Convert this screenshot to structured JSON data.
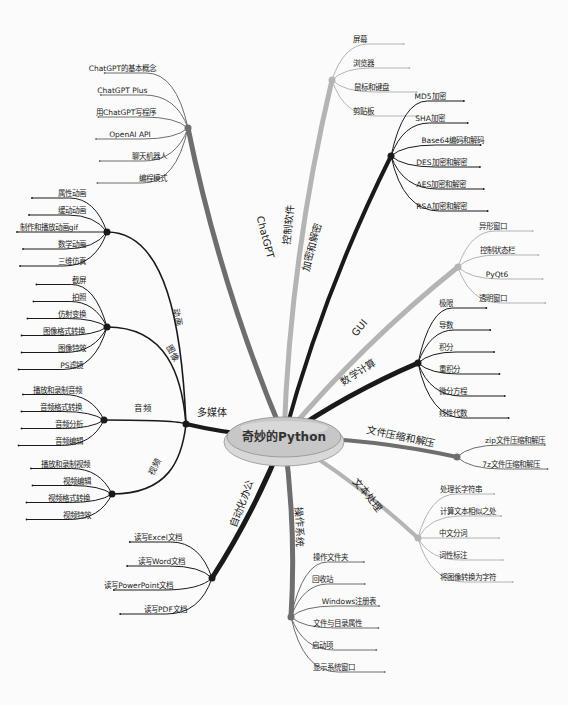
{
  "root": {
    "label": "奇妙的Python",
    "x": 284,
    "y": 437
  },
  "colors": {
    "dark": "#1a1a1a",
    "mid": "#6e6e6e",
    "light": "#b4b4b4",
    "root_fill": "#c9c9c9",
    "root_stroke": "#9a9a9a"
  },
  "branches": [
    {
      "id": "chatgpt",
      "label": "ChatGPT",
      "color": "mid",
      "width": 5,
      "hub": [
        188,
        128
      ],
      "label_pos": [
        262,
        238
      ],
      "label_rot": 75,
      "children": [
        "ChatGPT的基本概念",
        "ChatGPT Plus",
        "用ChatGPT写程序",
        "OpenAI API",
        "聊天机器人",
        "编程模式"
      ]
    },
    {
      "id": "control",
      "label": "控制软件",
      "color": "light",
      "width": 5,
      "hub": [
        332,
        80
      ],
      "label_pos": [
        292,
        225
      ],
      "label_rot": -85,
      "children": [
        "屏幕",
        "浏览器",
        "鼠标和键盘",
        "剪贴板"
      ]
    },
    {
      "id": "crypto",
      "label": "加密和解密",
      "color": "dark",
      "width": 4,
      "hub": [
        391,
        156
      ],
      "label_pos": [
        315,
        248
      ],
      "label_rot": -75,
      "children": [
        "MD5加密",
        "SHA加密",
        "Base64编码和解码",
        "DES加密和解密",
        "AES加密和解密",
        "RSA加密和解密"
      ]
    },
    {
      "id": "gui",
      "label": "GUI",
      "color": "light",
      "width": 5,
      "hub": [
        458,
        267
      ],
      "label_pos": [
        362,
        330
      ],
      "label_rot": -50,
      "children": [
        "异形窗口",
        "控制状态栏",
        "PyQt6",
        "透明窗口"
      ]
    },
    {
      "id": "math",
      "label": "数学计算",
      "color": "dark",
      "width": 5,
      "hub": [
        418,
        363
      ],
      "label_pos": [
        360,
        375
      ],
      "label_rot": -32,
      "children": [
        "极限",
        "导数",
        "积分",
        "重积分",
        "微分方程",
        "线性代数"
      ]
    },
    {
      "id": "zip",
      "label": "文件压缩和解压",
      "color": "mid",
      "width": 4,
      "hub": [
        457,
        457
      ],
      "label_pos": [
        400,
        440
      ],
      "label_rot": 12,
      "children": [
        "zip文件压缩和解压",
        "7z文件压缩和解压"
      ]
    },
    {
      "id": "text",
      "label": "文本处理",
      "color": "light",
      "width": 4,
      "hub": [
        418,
        538
      ],
      "label_pos": [
        365,
        497
      ],
      "label_rot": 50,
      "children": [
        "处理长字符串",
        "计算文本相似之处",
        "中文分词",
        "词性标注",
        "将图像转换为字符"
      ]
    },
    {
      "id": "os",
      "label": "操作系统",
      "color": "mid",
      "width": 5,
      "hub": [
        291,
        617
      ],
      "label_pos": [
        296,
        527
      ],
      "label_rot": 88,
      "children": [
        "操作文件夹",
        "回收站",
        "Windows注册表",
        "文件与目录属性",
        "启动项",
        "显示系统窗口"
      ]
    },
    {
      "id": "office",
      "label": "自动化办公",
      "color": "dark",
      "width": 5,
      "hub": [
        212,
        578
      ],
      "label_pos": [
        245,
        505
      ],
      "label_rot": -70,
      "children": [
        "读写Excel文档",
        "读写Word文档",
        "读写PowerPoint文档",
        "读写PDF文档"
      ]
    },
    {
      "id": "media",
      "label": "多媒体",
      "color": "dark",
      "width": 4,
      "hub": [
        186,
        424
      ],
      "label_pos": [
        212,
        416
      ],
      "label_rot": 0,
      "subs": [
        {
          "label": "动画",
          "hub": [
            107,
            232
          ],
          "label_pos": [
            175,
            318
          ],
          "label_rot": 80,
          "children": [
            "属性动画",
            "缓动动画",
            "制作和播放动画gif",
            "数学动画",
            "三维仿真"
          ]
        },
        {
          "label": "图像",
          "hub": [
            107,
            327
          ],
          "label_pos": [
            170,
            355
          ],
          "label_rot": 60,
          "children": [
            "截屏",
            "拍照",
            "仿射变换",
            "图像格式转换",
            "图像特效",
            "PS滤镜"
          ]
        },
        {
          "label": "音频",
          "hub": [
            104,
            420
          ],
          "label_pos": [
            143,
            411
          ],
          "label_rot": 0,
          "children": [
            "播放和录制音频",
            "音频格式转换",
            "音频分析",
            "音频编辑"
          ]
        },
        {
          "label": "视频",
          "hub": [
            112,
            494
          ],
          "label_pos": [
            157,
            468
          ],
          "label_rot": -60,
          "children": [
            "播放和录制视频",
            "视频编辑",
            "视频格式转换",
            "视频特效"
          ]
        }
      ]
    }
  ]
}
